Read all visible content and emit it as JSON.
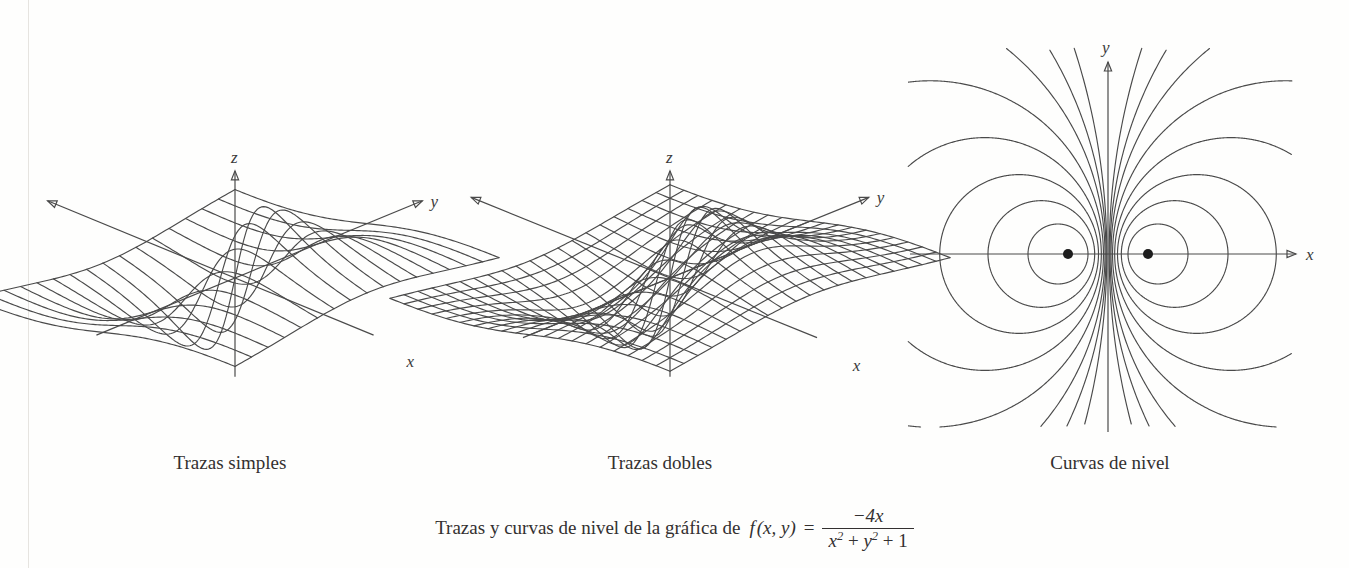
{
  "figure": {
    "kind": "textbook-figure",
    "language": "es",
    "panels": [
      {
        "id": "single",
        "caption": "Trazas simples",
        "render": "surface-single-traces"
      },
      {
        "id": "double",
        "caption": "Trazas dobles",
        "render": "surface-mesh"
      },
      {
        "id": "contour",
        "caption": "Curvas de nivel",
        "render": "level-curves"
      }
    ],
    "main_caption": {
      "lead": "Trazas y curvas de nivel de la gráfica de",
      "function_name": "f",
      "arguments": "(x, y)",
      "equals": "=",
      "numerator": "−4x",
      "denominator": "x² + y² + 1",
      "denominator_parts": [
        "x",
        "2",
        "+",
        "y",
        "2",
        "+",
        "1"
      ]
    },
    "axes": {
      "panel_3d_labels": [
        "x",
        "y",
        "z"
      ],
      "panel_contour_labels": [
        "x",
        "y"
      ]
    },
    "colors": {
      "ink": "#4a4a4a",
      "text": "#333030",
      "background": "#fefefd",
      "rule": "#e6e4e0",
      "dot": "#1d1d1d"
    }
  },
  "chart_data": {
    "type": "line",
    "function": "f(x,y) = -4x / (x^2 + y^2 + 1)",
    "xlabel": "x",
    "ylabel": "y",
    "zlabel": "z",
    "domain": {
      "x": [
        -4,
        4
      ],
      "y": [
        -4,
        4
      ]
    },
    "zlim": [
      -2,
      2
    ],
    "grid": false,
    "legend": null,
    "panels": [
      {
        "name": "Trazas simples",
        "type": "line",
        "description": "Superficie mostrada con trazas en una sola dirección (curvas y = const)",
        "trace_count": 17,
        "trace_direction": "y = constante",
        "trace_values": [
          -4,
          -3.5,
          -3,
          -2.5,
          -2,
          -1.5,
          -1,
          -0.5,
          0,
          0.5,
          1,
          1.5,
          2,
          2.5,
          3,
          3.5,
          4
        ]
      },
      {
        "name": "Trazas dobles",
        "type": "line",
        "description": "Superficie mostrada como malla: trazas en ambas direcciones",
        "trace_count_u": 21,
        "trace_count_v": 21,
        "trace_direction": "x = constante y y = constante"
      },
      {
        "name": "Curvas de nivel",
        "type": "line",
        "description": "Curvas de nivel f(x,y) = c en el plano xy; circunferencias desplazadas alrededor de los puntos críticos",
        "levels": [
          -2,
          -1.6,
          -1.2,
          -0.9,
          -0.65,
          -0.45,
          -0.3,
          -0.2,
          -0.12,
          0.12,
          0.2,
          0.3,
          0.45,
          0.65,
          0.9,
          1.2,
          1.6,
          2
        ],
        "critical_points": [
          {
            "x": -1,
            "y": 0,
            "z": 2,
            "type": "maximo"
          },
          {
            "x": 1,
            "y": 0,
            "z": -2,
            "type": "minimo"
          }
        ],
        "marked_points_count": 2
      }
    ]
  }
}
